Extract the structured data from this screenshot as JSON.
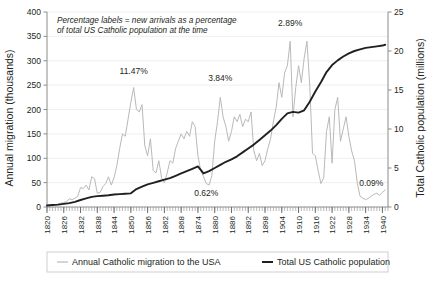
{
  "chart_data": {
    "type": "line",
    "title": "",
    "xlabel": "",
    "ylabel": "Annual migration (thousands)",
    "y2label": "Total Catholic population (millions)",
    "xlim": [
      1820,
      1942
    ],
    "ylim": [
      0,
      400
    ],
    "y2lim": [
      0,
      25
    ],
    "grid": true,
    "legend_position": "bottom",
    "yticks": [
      0,
      50,
      100,
      150,
      200,
      250,
      300,
      350,
      400
    ],
    "y2ticks": [
      0,
      5,
      10,
      15,
      20,
      25
    ],
    "xticks": [
      1820,
      1826,
      1832,
      1838,
      1844,
      1850,
      1856,
      1862,
      1868,
      1874,
      1880,
      1886,
      1892,
      1898,
      1904,
      1910,
      1916,
      1922,
      1928,
      1934,
      1940
    ],
    "xtick_minor_step": 1,
    "annotation": {
      "line1": "Percentage labels = new arrivals as a percentage",
      "line2": "of total US Catholic population at the time"
    },
    "point_labels": [
      {
        "text": "11.47%",
        "x": 1851,
        "y": 272
      },
      {
        "text": "3.84%",
        "x": 1882,
        "y": 258
      },
      {
        "text": "0.62%",
        "x": 1877,
        "y": 22
      },
      {
        "text": "2.89%",
        "x": 1907,
        "y": 372
      },
      {
        "text": "0.09%",
        "x": 1936,
        "y": 44
      }
    ],
    "series": [
      {
        "name": "Annual Catholic migration to the USA",
        "axis": "left",
        "color": "#b9b9b9",
        "width": 1,
        "x": [
          1820,
          1821,
          1822,
          1823,
          1824,
          1825,
          1826,
          1827,
          1828,
          1829,
          1830,
          1831,
          1832,
          1833,
          1834,
          1835,
          1836,
          1837,
          1838,
          1839,
          1840,
          1841,
          1842,
          1843,
          1844,
          1845,
          1846,
          1847,
          1848,
          1849,
          1850,
          1851,
          1852,
          1853,
          1854,
          1855,
          1856,
          1857,
          1858,
          1859,
          1860,
          1861,
          1862,
          1863,
          1864,
          1865,
          1866,
          1867,
          1868,
          1869,
          1870,
          1871,
          1872,
          1873,
          1874,
          1875,
          1876,
          1877,
          1878,
          1879,
          1880,
          1881,
          1882,
          1883,
          1884,
          1885,
          1886,
          1887,
          1888,
          1889,
          1890,
          1891,
          1892,
          1893,
          1894,
          1895,
          1896,
          1897,
          1898,
          1899,
          1900,
          1901,
          1902,
          1903,
          1904,
          1905,
          1906,
          1907,
          1908,
          1909,
          1910,
          1911,
          1912,
          1913,
          1914,
          1915,
          1916,
          1917,
          1918,
          1919,
          1920,
          1921,
          1922,
          1923,
          1924,
          1925,
          1926,
          1927,
          1928,
          1929,
          1930,
          1931,
          1932,
          1933,
          1934,
          1935,
          1936,
          1937,
          1938,
          1939,
          1940,
          1941
        ],
        "values": [
          3,
          4,
          4,
          5,
          6,
          8,
          9,
          11,
          17,
          15,
          18,
          22,
          40,
          38,
          45,
          35,
          62,
          58,
          28,
          30,
          42,
          48,
          62,
          45,
          60,
          85,
          120,
          150,
          145,
          180,
          215,
          245,
          200,
          195,
          210,
          125,
          105,
          140,
          75,
          70,
          95,
          60,
          50,
          70,
          95,
          90,
          120,
          135,
          150,
          140,
          155,
          145,
          175,
          165,
          105,
          75,
          62,
          48,
          45,
          65,
          135,
          175,
          225,
          185,
          165,
          135,
          155,
          185,
          175,
          190,
          165,
          180,
          175,
          195,
          115,
          95,
          110,
          85,
          95,
          120,
          140,
          175,
          205,
          255,
          225,
          275,
          290,
          340,
          185,
          245,
          290,
          255,
          305,
          340,
          250,
          110,
          105,
          75,
          48,
          60,
          155,
          185,
          90,
          200,
          225,
          135,
          160,
          185,
          145,
          115,
          95,
          50,
          22,
          18,
          15,
          18,
          22,
          26,
          28,
          24,
          30,
          35
        ]
      },
      {
        "name": "Total US Catholic population",
        "axis": "right",
        "color": "#231f20",
        "width": 1.9,
        "x": [
          1820,
          1822,
          1824,
          1826,
          1828,
          1830,
          1832,
          1834,
          1836,
          1838,
          1840,
          1842,
          1844,
          1846,
          1848,
          1850,
          1852,
          1854,
          1856,
          1858,
          1860,
          1862,
          1864,
          1866,
          1868,
          1870,
          1872,
          1874,
          1876,
          1878,
          1880,
          1882,
          1884,
          1886,
          1888,
          1890,
          1892,
          1894,
          1896,
          1898,
          1900,
          1902,
          1904,
          1906,
          1908,
          1910,
          1912,
          1914,
          1916,
          1918,
          1920,
          1922,
          1924,
          1926,
          1928,
          1930,
          1932,
          1934,
          1936,
          1938,
          1940,
          1941
        ],
        "values": [
          0.2,
          0.25,
          0.3,
          0.4,
          0.5,
          0.65,
          0.9,
          1.1,
          1.3,
          1.4,
          1.45,
          1.5,
          1.6,
          1.65,
          1.7,
          1.75,
          2.3,
          2.6,
          2.9,
          3.1,
          3.3,
          3.5,
          3.7,
          4.0,
          4.3,
          4.6,
          4.9,
          5.2,
          4.3,
          4.6,
          5.0,
          5.4,
          5.8,
          6.1,
          6.5,
          7.0,
          7.5,
          8.0,
          8.6,
          9.2,
          9.8,
          10.5,
          11.3,
          12.0,
          12.2,
          12.1,
          12.4,
          13.5,
          14.8,
          16.0,
          17.3,
          18.2,
          18.8,
          19.3,
          19.7,
          20.0,
          20.2,
          20.4,
          20.5,
          20.6,
          20.7,
          20.8
        ]
      }
    ]
  },
  "legend": {
    "items": [
      {
        "label": "Annual Catholic migration to the USA",
        "color": "#b9b9b9"
      },
      {
        "label": "Total US Catholic population",
        "color": "#231f20"
      }
    ]
  }
}
